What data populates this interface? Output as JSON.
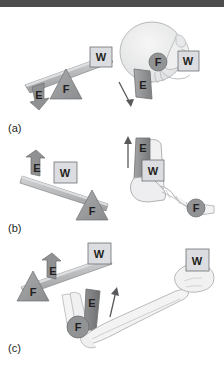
{
  "figure": {
    "background_color": "#ffffff",
    "topbar_color": "#4d4d4d"
  },
  "colors": {
    "bar_fill": "#b5b7b9",
    "bar_stroke": "#8a8c8e",
    "bar_top": "#cfd1d3",
    "fulcrum_fill": "#9a9c9e",
    "fulcrum_stroke": "#76787a",
    "weight_fill": "#d9dadb",
    "weight_stroke": "#6d6f71",
    "effort_fill": "#8d8f91",
    "effort_stroke": "#6d6f71",
    "bone_fill": "#f2f2f2",
    "bone_stroke": "#a8aaac",
    "muscle_fill": "#9a9c9e",
    "skull_fill": "#ededee",
    "arrow_stroke": "#58595b",
    "text": "#231f20"
  },
  "legend": {
    "effort": "E",
    "weight": "W",
    "fulcrum": "F"
  },
  "panels": [
    {
      "id": "a",
      "label": "(a)",
      "lever_class": "first-class",
      "diagram": {
        "name": "first-class-lever-diagram",
        "effort_label": "E",
        "effort_direction": "down",
        "weight_label": "W",
        "fulcrum_label": "F",
        "order": "E - F - W"
      },
      "anatomy": {
        "name": "skull-neck-example",
        "structure": "skull",
        "effort_label": "E",
        "effort_direction": "down",
        "weight_label": "W",
        "fulcrum_label": "F"
      }
    },
    {
      "id": "b",
      "label": "(b)",
      "lever_class": "second-class",
      "diagram": {
        "name": "second-class-lever-diagram",
        "effort_label": "E",
        "effort_direction": "up",
        "weight_label": "W",
        "fulcrum_label": "F",
        "order": "E - W - F"
      },
      "anatomy": {
        "name": "foot-ankle-example",
        "structure": "foot",
        "effort_label": "E",
        "effort_direction": "up",
        "weight_label": "W",
        "fulcrum_label": "F"
      }
    },
    {
      "id": "c",
      "label": "(c)",
      "lever_class": "third-class",
      "diagram": {
        "name": "third-class-lever-diagram",
        "effort_label": "E",
        "effort_direction": "up",
        "weight_label": "W",
        "fulcrum_label": "F",
        "order": "F - E - W"
      },
      "anatomy": {
        "name": "arm-elbow-example",
        "structure": "forearm",
        "effort_label": "E",
        "effort_direction": "up",
        "weight_label": "W",
        "fulcrum_label": "F"
      }
    }
  ]
}
